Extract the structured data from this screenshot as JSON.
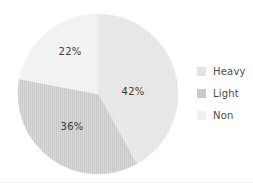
{
  "chart_data": {
    "type": "pie",
    "title": "",
    "categories": [
      "Heavy",
      "Light",
      "Non"
    ],
    "values": [
      42,
      36,
      22
    ],
    "labels": [
      "42%",
      "36%",
      "22%"
    ],
    "unit": "percent",
    "total": 100,
    "start_angle_deg": 0,
    "direction": "clockwise",
    "legend_position": "right",
    "grid": false,
    "colors": [
      "#e4e4e4",
      "#c9c9c9",
      "#f0f0f0"
    ],
    "slices": [
      {
        "name": "Heavy",
        "value": 42,
        "label": "42%",
        "color": "#e4e4e4",
        "start_deg": 0,
        "end_deg": 151.2,
        "label_x": 133,
        "label_y": 91
      },
      {
        "name": "Light",
        "value": 36,
        "label": "36%",
        "color": "#c9c9c9",
        "start_deg": 151.2,
        "end_deg": 280.8,
        "label_x": 72,
        "label_y": 126
      },
      {
        "name": "Non",
        "value": 22,
        "label": "22%",
        "color": "#f0f0f0",
        "start_deg": 280.8,
        "end_deg": 360,
        "label_x": 70,
        "label_y": 51
      }
    ]
  },
  "legend": {
    "items": [
      {
        "label": "Heavy",
        "color": "#e4e4e4"
      },
      {
        "label": "Light",
        "color": "#c9c9c9"
      },
      {
        "label": "Non",
        "color": "#f0f0f0"
      }
    ]
  },
  "geometry": {
    "center_x": 98,
    "center_y": 94,
    "radius": 80
  }
}
